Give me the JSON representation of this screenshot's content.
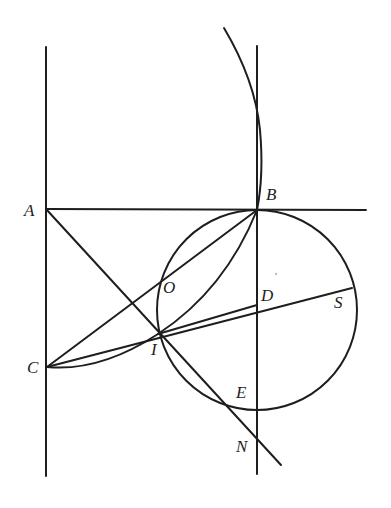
{
  "diagram": {
    "type": "geometry-construction",
    "labels": {
      "A": "A",
      "B": "B",
      "C": "C",
      "D": "D",
      "E": "E",
      "I": "I",
      "N": "N",
      "O": "O",
      "S": "S",
      "prime": "′"
    },
    "points": {
      "A": [
        46,
        209
      ],
      "B": [
        257,
        210
      ],
      "C": [
        47,
        367
      ],
      "I": [
        158,
        334
      ],
      "O": [
        162,
        277
      ],
      "S": [
        352,
        288
      ],
      "N": [
        257,
        436
      ],
      "E": [
        257,
        411
      ]
    },
    "circle": {
      "center": [
        257,
        310
      ],
      "radius": 100
    },
    "colors": {
      "ink": "#1e1e1e",
      "background": "#ffffff"
    }
  }
}
